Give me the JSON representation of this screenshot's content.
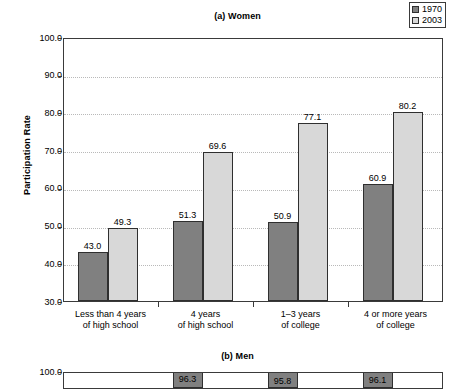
{
  "figure": {
    "legend": {
      "position": "top-right",
      "entries": [
        {
          "label": "1970",
          "color": "#808080"
        },
        {
          "label": "2003",
          "color": "#d8d8d8"
        }
      ]
    }
  },
  "chart_data": [
    {
      "type": "bar",
      "panel": "a",
      "title": "(a) Women",
      "xlabel": "",
      "ylabel": "Participation Rate",
      "ylim": [
        30.0,
        100.0
      ],
      "ytick_labels": [
        "30.0",
        "40.0",
        "50.0",
        "60.0",
        "70.0",
        "80.0",
        "90.0",
        "100.0"
      ],
      "yticks": [
        30.0,
        40.0,
        50.0,
        60.0,
        70.0,
        80.0,
        90.0,
        100.0
      ],
      "grid": true,
      "legend_position": "top-right",
      "categories": [
        "Less than 4 years\nof high school",
        "4 years\nof high school",
        "1–3 years\nof college",
        "4 or more years\nof college"
      ],
      "category_lines": [
        [
          "Less than 4 years",
          "of high school"
        ],
        [
          "4 years",
          "of high school"
        ],
        [
          "1–3 years",
          "of college"
        ],
        [
          "4 or more years",
          "of college"
        ]
      ],
      "series": [
        {
          "name": "1970",
          "color": "#808080",
          "values": [
            43.0,
            51.3,
            50.9,
            60.9
          ],
          "labels": [
            "43.0",
            "51.3",
            "50.9",
            "60.9"
          ]
        },
        {
          "name": "2003",
          "color": "#d8d8d8",
          "values": [
            49.3,
            69.6,
            77.1,
            80.2
          ],
          "labels": [
            "49.3",
            "69.6",
            "77.1",
            "80.2"
          ]
        }
      ]
    },
    {
      "type": "bar",
      "panel": "b",
      "title": "(b) Men",
      "xlabel": "",
      "ylabel": "",
      "ylim": [
        30.0,
        100.0
      ],
      "ytick_labels": [
        "100.0"
      ],
      "yticks": [
        100.0
      ],
      "grid": true,
      "clipped": true,
      "categories": [
        "Less than 4 years\nof high school",
        "4 years\nof high school",
        "1–3 years\nof college",
        "4 or more years\nof college"
      ],
      "series": [
        {
          "name": "1970",
          "color": "#808080",
          "values": [
            null,
            96.3,
            95.8,
            96.1
          ],
          "labels": [
            "",
            "96.3",
            "95.8",
            "96.1"
          ]
        },
        {
          "name": "2003",
          "color": "#d8d8d8",
          "values": [
            null,
            null,
            null,
            null
          ],
          "labels": [
            "",
            "",
            "",
            ""
          ]
        }
      ]
    }
  ]
}
